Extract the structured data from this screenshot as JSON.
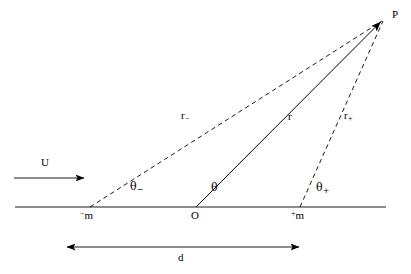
{
  "figure": {
    "type": "geometry-diagram",
    "title": "",
    "background_color": "#ffffff",
    "stroke_color": "#000000"
  },
  "labels": {
    "point_p": "P",
    "point_o": "O",
    "point_m_minus_sup": "−",
    "point_m_minus_base": "m",
    "point_m_plus_sup": "+",
    "point_m_plus_base": "m",
    "flow_u": "U",
    "distance_d": "d",
    "r_minus_base": "r",
    "r_minus_sub": "−",
    "r_center": "r",
    "r_plus_base": "r",
    "r_plus_sub": "+",
    "theta_minus_base": "θ",
    "theta_minus_sub": "−",
    "theta_center": "θ",
    "theta_plus_base": "θ",
    "theta_plus_sub": "+"
  },
  "geometry": {
    "baseline": {
      "x1": 15,
      "y1": 207,
      "x2": 386,
      "y2": 207
    },
    "point_p": {
      "x": 383,
      "y": 20
    },
    "point_o": {
      "x": 196,
      "y": 207
    },
    "point_m_minus": {
      "x": 90,
      "y": 207
    },
    "point_m_plus": {
      "x": 300,
      "y": 207
    },
    "solid_r": {
      "x1": 196,
      "y1": 207,
      "x2": 383,
      "y2": 20
    },
    "dashed_r_minus": {
      "x1": 90,
      "y1": 207,
      "x2": 383,
      "y2": 20
    },
    "dashed_r_plus": {
      "x1": 300,
      "y1": 207,
      "x2": 383,
      "y2": 20
    },
    "u_arrow": {
      "x1": 14,
      "y1": 178,
      "x2": 86,
      "y2": 178
    },
    "d_arrow": {
      "x1": 66,
      "y1": 247,
      "x2": 300,
      "y2": 247
    }
  },
  "label_positions": {
    "point_p": {
      "x": 392,
      "y": 14
    },
    "point_o": {
      "x": 191,
      "y": 212
    },
    "point_m_minus": {
      "x": 81,
      "y": 212
    },
    "point_m_plus": {
      "x": 292,
      "y": 212
    },
    "flow_u": {
      "x": 42,
      "y": 160
    },
    "distance_d": {
      "x": 179,
      "y": 254
    },
    "r_minus": {
      "x": 182,
      "y": 113
    },
    "r_center": {
      "x": 289,
      "y": 114
    },
    "r_plus": {
      "x": 345,
      "y": 113
    },
    "theta_minus": {
      "x": 131,
      "y": 184
    },
    "theta_center": {
      "x": 212,
      "y": 185
    },
    "theta_plus": {
      "x": 317,
      "y": 185
    }
  }
}
